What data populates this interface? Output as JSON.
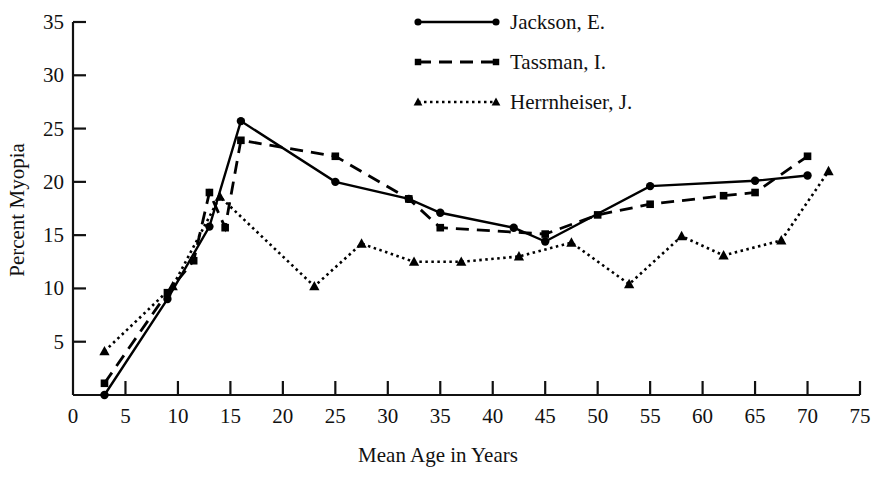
{
  "chart_data": {
    "type": "line",
    "title": "",
    "xlabel": "Mean Age in Years",
    "ylabel": "Percent Myopia",
    "xlim": [
      0,
      75
    ],
    "ylim": [
      0,
      35
    ],
    "xticks": [
      0,
      5,
      10,
      15,
      20,
      25,
      30,
      35,
      40,
      45,
      50,
      55,
      60,
      65,
      70,
      75
    ],
    "yticks": [
      5,
      10,
      15,
      20,
      25,
      30,
      35
    ],
    "grid": false,
    "legend_position": "top-center",
    "series": [
      {
        "name": "Jackson, E.",
        "marker": "circle",
        "linestyle": "solid",
        "color": "#000000",
        "points": [
          [
            3,
            0.0
          ],
          [
            9,
            9.0
          ],
          [
            13,
            15.8
          ],
          [
            16,
            25.7
          ],
          [
            25,
            20.0
          ],
          [
            32,
            18.4
          ],
          [
            35,
            17.1
          ],
          [
            42,
            15.7
          ],
          [
            45,
            14.4
          ],
          [
            55,
            19.6
          ],
          [
            65,
            20.1
          ],
          [
            70,
            20.6
          ]
        ]
      },
      {
        "name": "Tassman, I.",
        "marker": "square",
        "linestyle": "dashed",
        "color": "#000000",
        "points": [
          [
            3,
            1.1
          ],
          [
            9,
            9.6
          ],
          [
            11.5,
            12.6
          ],
          [
            13,
            19.0
          ],
          [
            14.5,
            15.7
          ],
          [
            16,
            23.9
          ],
          [
            25,
            22.4
          ],
          [
            32,
            18.4
          ],
          [
            35,
            15.7
          ],
          [
            45,
            15.1
          ],
          [
            50,
            16.9
          ],
          [
            55,
            17.9
          ],
          [
            62,
            18.7
          ],
          [
            65,
            19.0
          ],
          [
            70,
            22.4
          ]
        ]
      },
      {
        "name": "Herrnheiser, J.",
        "marker": "triangle",
        "linestyle": "dotted",
        "color": "#000000",
        "points": [
          [
            3,
            4.1
          ],
          [
            9.5,
            10.2
          ],
          [
            14,
            18.6
          ],
          [
            23,
            10.2
          ],
          [
            27.5,
            14.2
          ],
          [
            32.5,
            12.5
          ],
          [
            37,
            12.5
          ],
          [
            42.5,
            13.0
          ],
          [
            47.5,
            14.3
          ],
          [
            53,
            10.4
          ],
          [
            58,
            14.9
          ],
          [
            62,
            13.1
          ],
          [
            67.5,
            14.5
          ],
          [
            72,
            21.0
          ]
        ]
      }
    ]
  },
  "legend": {
    "entries": [
      {
        "label": "Jackson, E."
      },
      {
        "label": "Tassman, I."
      },
      {
        "label": "Herrnheiser, J."
      }
    ]
  }
}
